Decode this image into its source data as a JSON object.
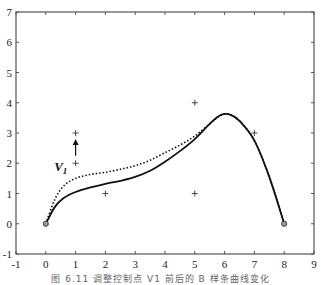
{
  "chart_data": {
    "type": "line",
    "title": "",
    "xlabel": "",
    "ylabel": "",
    "xlim": [
      -1,
      9
    ],
    "ylim": [
      -1,
      7
    ],
    "x_ticks": [
      "-1",
      "0",
      "1",
      "2",
      "3",
      "4",
      "5",
      "6",
      "7",
      "8",
      "9"
    ],
    "y_ticks": [
      "-1",
      "0",
      "1",
      "2",
      "3",
      "4",
      "5",
      "6",
      "7"
    ],
    "grid": false,
    "control_points": [
      {
        "x": 1,
        "y": 2
      },
      {
        "x": 1,
        "y": 3
      },
      {
        "x": 2,
        "y": 1
      },
      {
        "x": 5,
        "y": 1
      },
      {
        "x": 5,
        "y": 4
      },
      {
        "x": 7,
        "y": 3
      }
    ],
    "endpoints": [
      {
        "x": 0,
        "y": 0
      },
      {
        "x": 8,
        "y": 0
      }
    ],
    "series": [
      {
        "name": "solid-curve",
        "style": "solid",
        "points": [
          [
            0,
            0
          ],
          [
            0.3,
            0.55
          ],
          [
            0.6,
            0.85
          ],
          [
            1,
            1.05
          ],
          [
            1.5,
            1.2
          ],
          [
            2,
            1.32
          ],
          [
            2.5,
            1.42
          ],
          [
            3,
            1.55
          ],
          [
            3.5,
            1.75
          ],
          [
            4,
            2.05
          ],
          [
            4.5,
            2.4
          ],
          [
            5,
            2.8
          ],
          [
            5.5,
            3.3
          ],
          [
            5.8,
            3.55
          ],
          [
            6,
            3.63
          ],
          [
            6.2,
            3.6
          ],
          [
            6.5,
            3.4
          ],
          [
            7,
            2.75
          ],
          [
            7.5,
            1.55
          ],
          [
            8,
            0
          ]
        ]
      },
      {
        "name": "dotted-curve",
        "style": "dotted",
        "points": [
          [
            0,
            0
          ],
          [
            0.3,
            0.8
          ],
          [
            0.6,
            1.25
          ],
          [
            1,
            1.5
          ],
          [
            1.5,
            1.63
          ],
          [
            2,
            1.7
          ],
          [
            2.5,
            1.8
          ],
          [
            3,
            1.92
          ],
          [
            3.5,
            2.1
          ],
          [
            4,
            2.35
          ],
          [
            4.5,
            2.6
          ],
          [
            5,
            2.9
          ],
          [
            5.5,
            3.3
          ],
          [
            5.8,
            3.55
          ],
          [
            6,
            3.63
          ],
          [
            6.2,
            3.6
          ],
          [
            6.5,
            3.4
          ],
          [
            7,
            2.75
          ],
          [
            7.5,
            1.55
          ],
          [
            8,
            0
          ]
        ]
      }
    ],
    "annotations": [
      {
        "text": "V",
        "subscript": "1",
        "x": 0.55,
        "y": 1.9
      },
      {
        "type": "arrow",
        "from": {
          "x": 1,
          "y": 2.25
        },
        "to": {
          "x": 1,
          "y": 2.8
        }
      }
    ],
    "caption": "图 6.11  调整控制点 V1 前后的 B 样条曲线变化"
  }
}
